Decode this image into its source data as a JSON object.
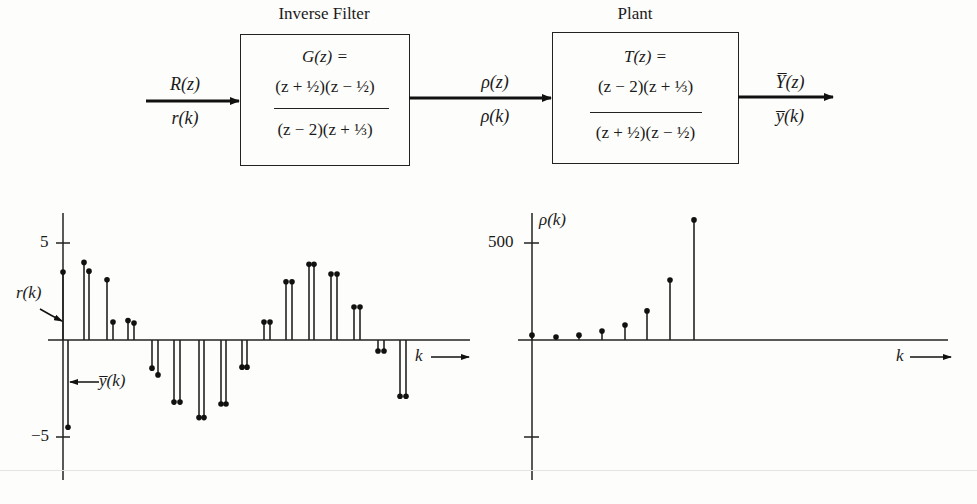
{
  "diagram": {
    "input": {
      "top": "R(z)",
      "bottom": "r(k)"
    },
    "blocks": [
      {
        "title": "Inverse Filter",
        "lhs": "G(z) =",
        "numerator": "(z + ½)(z − ½)",
        "denominator": "(z − 2)(z + ⅓)"
      },
      {
        "title": "Plant",
        "lhs": "T(z) =",
        "numerator": "(z − 2)(z + ⅓)",
        "denominator": "(z + ½)(z − ½)"
      }
    ],
    "middle": {
      "top": "ρ(z)",
      "bottom": "ρ(k)"
    },
    "output": {
      "top": "Y̅(z)",
      "bottom": "y̅(k)"
    }
  },
  "chart_data": [
    {
      "type": "stem",
      "title": "",
      "xlabel": "k",
      "ylabel": "",
      "y_ticks": [
        5,
        -5
      ],
      "y_tick_labels": [
        "5",
        "−5"
      ],
      "ylim": [
        -6.5,
        6.5
      ],
      "annotations": [
        "r(k)",
        "y̅(k)"
      ],
      "series": [
        {
          "name": "r(k)",
          "k": [
            0,
            1,
            2,
            3,
            4,
            5,
            6,
            7,
            8,
            9,
            10,
            11,
            12,
            13,
            14
          ],
          "values": [
            3.5,
            4.0,
            3.1,
            1.0,
            -1.45,
            -3.2,
            -4.0,
            -3.3,
            -1.4,
            0.93,
            3.0,
            3.9,
            3.4,
            1.7,
            -0.57,
            -2.9
          ]
        },
        {
          "name": "y̅(k)",
          "k": [
            0,
            1,
            2,
            3,
            4,
            5,
            6,
            7,
            8,
            9,
            10,
            11,
            12,
            13,
            14,
            15
          ],
          "values": [
            -4.5,
            3.55,
            0.93,
            0.88,
            -1.8,
            -3.2,
            -4.0,
            -3.3,
            -1.4,
            0.93,
            3.0,
            3.9,
            3.4,
            1.7,
            -0.57,
            -2.9
          ]
        }
      ],
      "grid": false,
      "legend": "none"
    },
    {
      "type": "stem",
      "title": "",
      "xlabel": "k",
      "ylabel": "ρ(k)",
      "y_ticks": [
        500,
        -500
      ],
      "y_tick_labels": [
        "500",
        ""
      ],
      "ylim": [
        -650,
        650
      ],
      "series": [
        {
          "name": "ρ(k)",
          "k": [
            0,
            1,
            2,
            3,
            4,
            5,
            6,
            7
          ],
          "values": [
            25,
            15,
            25,
            46,
            77,
            150,
            309,
            619
          ]
        }
      ],
      "grid": false,
      "legend": "none"
    }
  ],
  "plots": {
    "left": {
      "tick_pos": "5",
      "tick_neg": "−5",
      "r_label": "r(k)",
      "y_label": "y̅(k)",
      "k_label": "k"
    },
    "right": {
      "tick_pos": "500",
      "rho_label": "ρ(k)",
      "k_label": "k"
    }
  }
}
